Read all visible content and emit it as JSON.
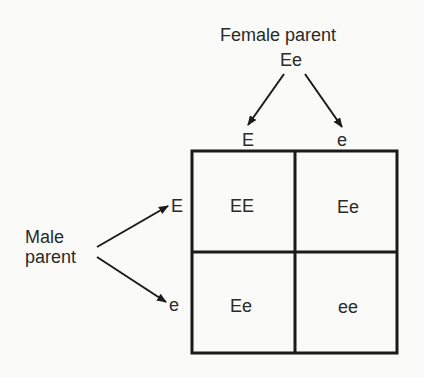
{
  "diagram": {
    "type": "punnett-square",
    "female_parent": {
      "label": "Female parent",
      "genotype": "Ee",
      "gametes": [
        "E",
        "e"
      ]
    },
    "male_parent": {
      "label_line1": "Male",
      "label_line2": "parent",
      "gametes": [
        "E",
        "e"
      ]
    },
    "grid": {
      "rows": [
        [
          "EE",
          "Ee"
        ],
        [
          "Ee",
          "ee"
        ]
      ]
    },
    "colors": {
      "line": "#1a1a1a",
      "text": "#2a2a2a",
      "background": "#fafaf8"
    }
  }
}
